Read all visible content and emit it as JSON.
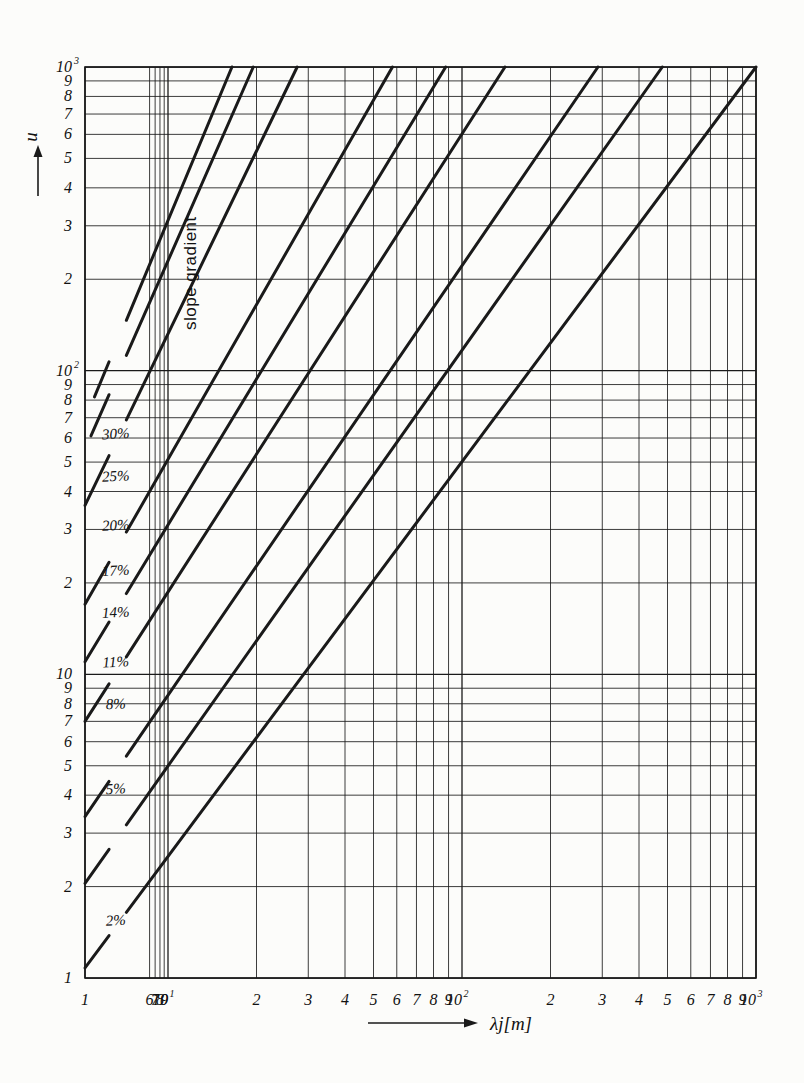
{
  "figure": {
    "kind": "log-log nomogram",
    "background": "#fcfcfa",
    "ink": "#1a1a1a"
  },
  "axes": {
    "y": {
      "label": "u",
      "arrow": "up-arrow-icon",
      "scale": "log",
      "min": 1,
      "max": 1000,
      "decade_labels": [
        "1",
        "10",
        "10",
        "10"
      ],
      "ticks": [
        {
          "v": 1,
          "text": "1",
          "sup": ""
        },
        {
          "v": 2,
          "text": "2",
          "sup": ""
        },
        {
          "v": 3,
          "text": "3",
          "sup": ""
        },
        {
          "v": 4,
          "text": "4",
          "sup": ""
        },
        {
          "v": 5,
          "text": "5",
          "sup": ""
        },
        {
          "v": 6,
          "text": "6",
          "sup": ""
        },
        {
          "v": 7,
          "text": "7",
          "sup": ""
        },
        {
          "v": 8,
          "text": "8",
          "sup": ""
        },
        {
          "v": 9,
          "text": "9",
          "sup": ""
        },
        {
          "v": 10,
          "text": "10",
          "sup": ""
        },
        {
          "v": 20,
          "text": "2",
          "sup": ""
        },
        {
          "v": 30,
          "text": "3",
          "sup": ""
        },
        {
          "v": 40,
          "text": "4",
          "sup": ""
        },
        {
          "v": 50,
          "text": "5",
          "sup": ""
        },
        {
          "v": 60,
          "text": "6",
          "sup": ""
        },
        {
          "v": 70,
          "text": "7",
          "sup": ""
        },
        {
          "v": 80,
          "text": "8",
          "sup": ""
        },
        {
          "v": 90,
          "text": "9",
          "sup": ""
        },
        {
          "v": 100,
          "text": "10",
          "sup": "2"
        },
        {
          "v": 200,
          "text": "2",
          "sup": ""
        },
        {
          "v": 300,
          "text": "3",
          "sup": ""
        },
        {
          "v": 400,
          "text": "4",
          "sup": ""
        },
        {
          "v": 500,
          "text": "5",
          "sup": ""
        },
        {
          "v": 600,
          "text": "6",
          "sup": ""
        },
        {
          "v": 700,
          "text": "7",
          "sup": ""
        },
        {
          "v": 800,
          "text": "8",
          "sup": ""
        },
        {
          "v": 900,
          "text": "9",
          "sup": ""
        },
        {
          "v": 1000,
          "text": "10",
          "sup": "3"
        }
      ]
    },
    "x": {
      "label": "λj[m]",
      "arrow": "right-arrow-icon",
      "scale": "log",
      "min": 1,
      "max": 1000,
      "ticks": [
        {
          "v": 1,
          "text": "1",
          "sup": ""
        },
        {
          "v": 6,
          "text": "6",
          "sup": ""
        },
        {
          "v": 7,
          "text": "7",
          "sup": ""
        },
        {
          "v": 8,
          "text": "8",
          "sup": ""
        },
        {
          "v": 9,
          "text": "9",
          "sup": ""
        },
        {
          "v": 10,
          "text": "10",
          "sup": "1"
        },
        {
          "v": 20,
          "text": "2",
          "sup": ""
        },
        {
          "v": 30,
          "text": "3",
          "sup": ""
        },
        {
          "v": 40,
          "text": "4",
          "sup": ""
        },
        {
          "v": 50,
          "text": "5",
          "sup": ""
        },
        {
          "v": 60,
          "text": "6",
          "sup": ""
        },
        {
          "v": 70,
          "text": "7",
          "sup": ""
        },
        {
          "v": 80,
          "text": "8",
          "sup": ""
        },
        {
          "v": 90,
          "text": "9",
          "sup": ""
        },
        {
          "v": 100,
          "text": "10",
          "sup": "2"
        },
        {
          "v": 200,
          "text": "2",
          "sup": ""
        },
        {
          "v": 300,
          "text": "3",
          "sup": ""
        },
        {
          "v": 400,
          "text": "4",
          "sup": ""
        },
        {
          "v": 500,
          "text": "5",
          "sup": ""
        },
        {
          "v": 600,
          "text": "6",
          "sup": ""
        },
        {
          "v": 700,
          "text": "7",
          "sup": ""
        },
        {
          "v": 800,
          "text": "8",
          "sup": ""
        },
        {
          "v": 900,
          "text": "9",
          "sup": ""
        },
        {
          "v": 1000,
          "text": "10",
          "sup": "3"
        }
      ]
    }
  },
  "annotations": {
    "family_caption": "slope gradient"
  },
  "chart_data": {
    "type": "line",
    "title": "",
    "subtitle": "",
    "xlabel": "λj[m]",
    "ylabel": "u",
    "xscale": "log",
    "yscale": "log",
    "xlim": [
      1,
      1000
    ],
    "ylim": [
      1,
      1000
    ],
    "grid": true,
    "legend_position": "inline-labels",
    "legend_title": "slope gradient",
    "annotations": [
      "slope gradient"
    ],
    "note": "Family of parallel straight lines on log-log axes (slope 1). Each line is labelled with its slope gradient in percent. Labels interrupt each line near the left-hand side.",
    "series": [
      {
        "name": "30%",
        "label": "30%",
        "label_at": {
          "x": 2.35,
          "y": 62
        },
        "p1": {
          "x": 1.3,
          "y": 82
        },
        "p2": {
          "x": 16.5,
          "y": 1000
        },
        "label_gap": {
          "x1": 1.95,
          "x2": 3.15
        }
      },
      {
        "name": "25%",
        "label": "25%",
        "label_at": {
          "x": 2.35,
          "y": 45
        },
        "p1": {
          "x": 1.18,
          "y": 61
        },
        "p2": {
          "x": 19.5,
          "y": 1000
        },
        "label_gap": {
          "x1": 1.95,
          "x2": 3.15
        }
      },
      {
        "name": "20%",
        "label": "20%",
        "label_at": {
          "x": 2.35,
          "y": 31
        },
        "p1": {
          "x": 1.0,
          "y": 36
        },
        "p2": {
          "x": 27.5,
          "y": 1000
        },
        "label_gap": {
          "x1": 1.95,
          "x2": 3.15
        }
      },
      {
        "name": "17%",
        "label": "17%",
        "label_at": {
          "x": 2.35,
          "y": 22
        },
        "p1": {
          "x": 1.0,
          "y": 17
        },
        "p2": {
          "x": 58,
          "y": 1000
        },
        "label_gap": {
          "x1": 1.95,
          "x2": 3.15
        }
      },
      {
        "name": "14%",
        "label": "14%",
        "label_at": {
          "x": 2.35,
          "y": 16
        },
        "p1": {
          "x": 1.0,
          "y": 11
        },
        "p2": {
          "x": 88,
          "y": 1000
        },
        "label_gap": {
          "x1": 1.95,
          "x2": 3.15
        }
      },
      {
        "name": "11%",
        "label": "11%",
        "label_at": {
          "x": 2.35,
          "y": 11
        },
        "p1": {
          "x": 1.0,
          "y": 7.0
        },
        "p2": {
          "x": 140,
          "y": 1000
        },
        "label_gap": {
          "x1": 1.95,
          "x2": 3.15
        }
      },
      {
        "name": "8%",
        "label": "8%",
        "label_at": {
          "x": 2.35,
          "y": 8.0
        },
        "p1": {
          "x": 1.0,
          "y": 3.4
        },
        "p2": {
          "x": 290,
          "y": 1000
        },
        "label_gap": {
          "x1": 1.95,
          "x2": 3.15
        }
      },
      {
        "name": "5%",
        "label": "5%",
        "label_at": {
          "x": 2.35,
          "y": 4.2
        },
        "p1": {
          "x": 1.0,
          "y": 2.05
        },
        "p2": {
          "x": 480,
          "y": 1000
        },
        "label_gap": {
          "x1": 1.95,
          "x2": 3.15
        }
      },
      {
        "name": "2%",
        "label": "2%",
        "label_at": {
          "x": 2.35,
          "y": 1.55
        },
        "p1": {
          "x": 1.0,
          "y": 1.08
        },
        "p2": {
          "x": 1000,
          "y": 1000
        },
        "label_gap": {
          "x1": 1.95,
          "x2": 3.15
        }
      }
    ]
  }
}
